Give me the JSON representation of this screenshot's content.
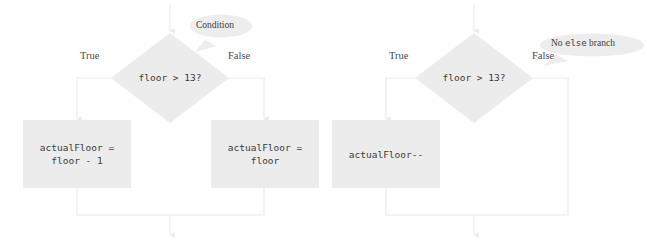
{
  "diagram": {
    "colors": {
      "shape_fill": "#ececec",
      "connector": "#f1f1f1",
      "callout_fill": "#ededed",
      "code_text": "#3a3a3a",
      "label_text": "#4a4a4a",
      "background": "#ffffff"
    },
    "flowcharts": [
      {
        "id": "if-else",
        "decision": {
          "text": "floor > 13?"
        },
        "true_label": "True",
        "false_label": "False",
        "true_branch": {
          "line1": "actualFloor =",
          "line2": "floor - 1"
        },
        "false_branch": {
          "line1": "actualFloor =",
          "line2": "floor"
        },
        "callout": {
          "prefix": "Condition",
          "mono": "",
          "suffix": ""
        }
      },
      {
        "id": "if-only",
        "decision": {
          "text": "floor > 13?"
        },
        "true_label": "True",
        "false_label": "False",
        "true_branch": {
          "line1": "actualFloor--",
          "line2": ""
        },
        "false_branch": {
          "line1": "",
          "line2": ""
        },
        "callout": {
          "prefix": "No ",
          "mono": "else",
          "suffix": " branch"
        }
      }
    ]
  }
}
